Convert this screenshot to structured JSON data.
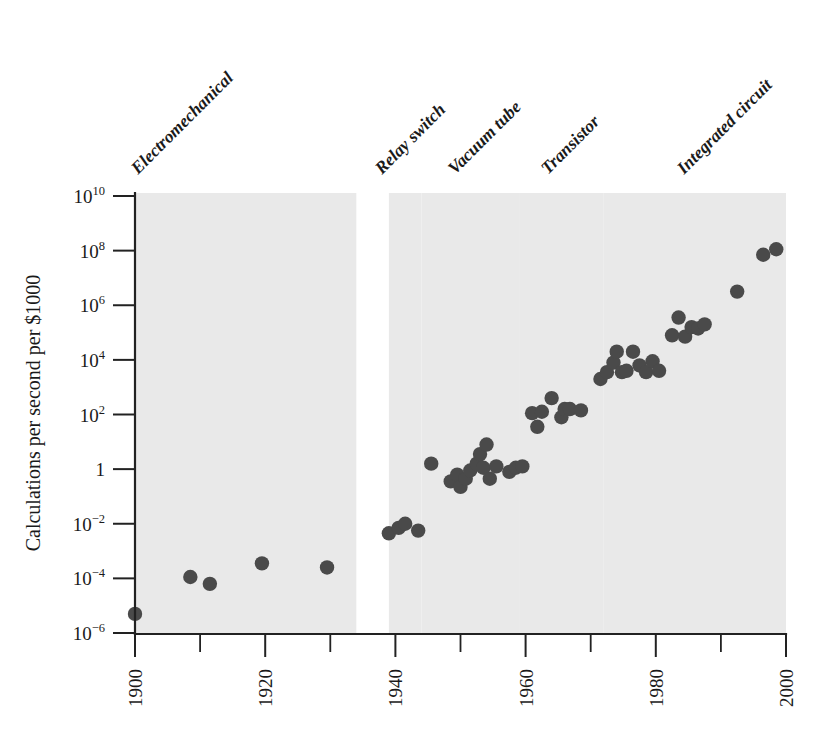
{
  "figure": {
    "title": "",
    "background_color": "#ffffff",
    "marker_color": "#4a4a4a",
    "band_color": "#e9e9e9",
    "axis_color": "#222222"
  },
  "axes": {
    "y_title": "Calculations per second per $1000",
    "x_title": "",
    "y_ticks": [
      {
        "mantissa": "10",
        "exponent": "10",
        "value": 10
      },
      {
        "mantissa": "10",
        "exponent": "8",
        "value": 8
      },
      {
        "mantissa": "10",
        "exponent": "6",
        "value": 6
      },
      {
        "mantissa": "10",
        "exponent": "4",
        "value": 4
      },
      {
        "mantissa": "10",
        "exponent": "2",
        "value": 2
      },
      {
        "mantissa": "1",
        "exponent": "",
        "value": 0
      },
      {
        "mantissa": "10",
        "exponent": "−2",
        "value": -2
      },
      {
        "mantissa": "10",
        "exponent": "−4",
        "value": -4
      },
      {
        "mantissa": "10",
        "exponent": "−6",
        "value": -6
      }
    ],
    "x_ticks_major": [
      "1900",
      "1920",
      "1940",
      "1960",
      "1980",
      "2000"
    ],
    "x_ticks_minor": [
      "1910",
      "1930",
      "1950",
      "1970",
      "1990"
    ]
  },
  "eras": [
    {
      "label": "Electromechanical",
      "start": 1900,
      "end": 1934
    },
    {
      "label": "Relay switch",
      "start": 1939,
      "end": 1944
    },
    {
      "label": "Vacuum tube",
      "start": 1944,
      "end": 1959
    },
    {
      "label": "Transistor",
      "start": 1959,
      "end": 1972
    },
    {
      "label": "Integrated circuit",
      "start": 1972,
      "end": 2000
    }
  ],
  "chart_data": {
    "type": "scatter",
    "title": "",
    "xlabel": "",
    "ylabel": "Calculations per second per $1000",
    "xlim": [
      1900,
      2000
    ],
    "ylim": [
      -6,
      10
    ],
    "y_scale": "log10",
    "grid": false,
    "legend": false,
    "series": [
      {
        "name": "Computing power",
        "points": [
          {
            "x": 1900.0,
            "y": -5.3
          },
          {
            "x": 1908.5,
            "y": -3.95
          },
          {
            "x": 1911.5,
            "y": -4.2
          },
          {
            "x": 1919.5,
            "y": -3.45
          },
          {
            "x": 1929.5,
            "y": -3.6
          },
          {
            "x": 1939.0,
            "y": -2.35
          },
          {
            "x": 1940.5,
            "y": -2.15
          },
          {
            "x": 1941.5,
            "y": -2.0
          },
          {
            "x": 1943.5,
            "y": -2.25
          },
          {
            "x": 1945.5,
            "y": 0.2
          },
          {
            "x": 1948.5,
            "y": -0.45
          },
          {
            "x": 1949.5,
            "y": -0.2
          },
          {
            "x": 1950.0,
            "y": -0.65
          },
          {
            "x": 1950.8,
            "y": -0.35
          },
          {
            "x": 1951.5,
            "y": -0.05
          },
          {
            "x": 1952.5,
            "y": 0.2
          },
          {
            "x": 1953.0,
            "y": 0.55
          },
          {
            "x": 1953.5,
            "y": 0.05
          },
          {
            "x": 1954.0,
            "y": 0.9
          },
          {
            "x": 1954.5,
            "y": -0.35
          },
          {
            "x": 1955.5,
            "y": 0.1
          },
          {
            "x": 1957.5,
            "y": -0.1
          },
          {
            "x": 1958.5,
            "y": 0.05
          },
          {
            "x": 1959.5,
            "y": 0.1
          },
          {
            "x": 1961.0,
            "y": 2.05
          },
          {
            "x": 1961.8,
            "y": 1.55
          },
          {
            "x": 1962.5,
            "y": 2.1
          },
          {
            "x": 1964.0,
            "y": 2.6
          },
          {
            "x": 1965.5,
            "y": 1.9
          },
          {
            "x": 1966.0,
            "y": 2.2
          },
          {
            "x": 1966.8,
            "y": 2.2
          },
          {
            "x": 1968.5,
            "y": 2.15
          },
          {
            "x": 1971.5,
            "y": 3.3
          },
          {
            "x": 1972.5,
            "y": 3.55
          },
          {
            "x": 1973.5,
            "y": 3.9
          },
          {
            "x": 1974.0,
            "y": 4.3
          },
          {
            "x": 1974.8,
            "y": 3.55
          },
          {
            "x": 1975.5,
            "y": 3.6
          },
          {
            "x": 1976.5,
            "y": 4.3
          },
          {
            "x": 1977.5,
            "y": 3.8
          },
          {
            "x": 1978.5,
            "y": 3.55
          },
          {
            "x": 1979.5,
            "y": 3.95
          },
          {
            "x": 1980.5,
            "y": 3.6
          },
          {
            "x": 1982.5,
            "y": 4.9
          },
          {
            "x": 1983.5,
            "y": 5.55
          },
          {
            "x": 1984.5,
            "y": 4.85
          },
          {
            "x": 1985.5,
            "y": 5.2
          },
          {
            "x": 1986.5,
            "y": 5.15
          },
          {
            "x": 1987.5,
            "y": 5.3
          },
          {
            "x": 1992.5,
            "y": 6.5
          },
          {
            "x": 1996.5,
            "y": 7.85
          },
          {
            "x": 1998.5,
            "y": 8.05
          }
        ]
      }
    ]
  }
}
